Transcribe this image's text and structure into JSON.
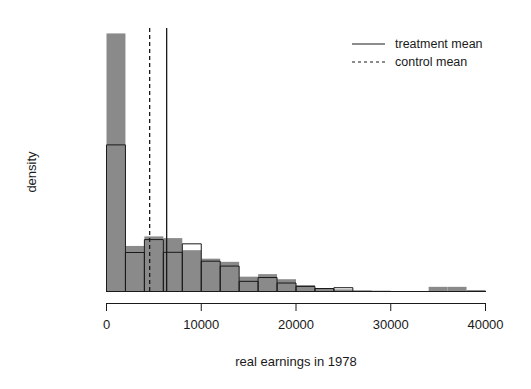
{
  "chart_data": {
    "type": "bar",
    "title": "",
    "subtitle": "",
    "xlabel": "real earnings in 1978",
    "ylabel": "density",
    "xlim": [
      -700,
      41000
    ],
    "ylim": [
      0,
      0.000122
    ],
    "grid": false,
    "xticks": [
      0,
      10000,
      20000,
      30000,
      40000
    ],
    "xtick_labels": [
      "0",
      "10000",
      "20000",
      "30000",
      "40000"
    ],
    "yticks": [],
    "ytick_labels": [],
    "bin_width": 2000,
    "bin_edges": [
      0,
      2000,
      4000,
      6000,
      8000,
      10000,
      12000,
      14000,
      16000,
      18000,
      20000,
      22000,
      24000,
      26000,
      28000,
      30000,
      32000,
      34000,
      36000,
      38000,
      40000
    ],
    "series": [
      {
        "name": "control",
        "style": "filled-gray",
        "color": "#8a8a8a",
        "values": [
          0.0001218,
          2.15e-05,
          2.6e-05,
          2.52e-05,
          1.95e-05,
          1.55e-05,
          1.4e-05,
          7e-06,
          8.2e-06,
          5.8e-06,
          3e-06,
          1.4e-06,
          1e-06,
          6e-07,
          4e-07,
          2e-07,
          2e-07,
          2.2e-06,
          2.2e-06,
          7e-07
        ]
      },
      {
        "name": "treatment",
        "style": "outline-white",
        "color": "#ffffff",
        "values": [
          6.92e-05,
          1.84e-05,
          2.45e-05,
          1.85e-05,
          2.25e-05,
          1.43e-05,
          1.2e-05,
          4.8e-06,
          6.6e-06,
          4e-06,
          2.4e-06,
          1.4e-06,
          1.8e-06,
          0.0,
          0.0,
          0.0,
          0.0,
          0.0,
          0.0,
          0.0
        ]
      }
    ],
    "vertical_lines": [
      {
        "name": "treatment mean",
        "x": 6349,
        "style": "solid"
      },
      {
        "name": "control mean",
        "x": 4555,
        "style": "dashed"
      }
    ],
    "legend": {
      "position": "top-right",
      "entries": [
        {
          "label": "treatment mean",
          "style": "solid"
        },
        {
          "label": "control mean",
          "style": "dashed"
        }
      ]
    }
  }
}
